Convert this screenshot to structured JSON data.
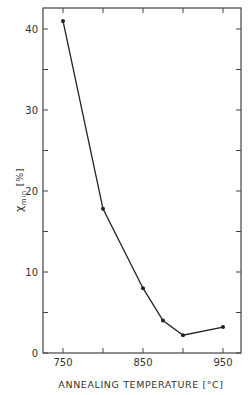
{
  "chart_data": {
    "type": "line",
    "title": "",
    "xlabel": "ANNEALING TEMPERATURE [°C]",
    "ylabel_main": "χ",
    "ylabel_sub": "min",
    "ylabel_unit": "[%]",
    "xlim": [
      725,
      975
    ],
    "ylim": [
      0,
      43.6
    ],
    "x_ticks": [
      750,
      800,
      850,
      900,
      950
    ],
    "x_tick_labels": [
      "750",
      "",
      "850",
      "",
      "950"
    ],
    "y_ticks": [
      0,
      5,
      10,
      15,
      20,
      25,
      30,
      35,
      40
    ],
    "y_tick_labels": [
      "0",
      "",
      "10",
      "",
      "20",
      "",
      "30",
      "",
      "40"
    ],
    "grid": false,
    "legend": null,
    "series": [
      {
        "name": "χmin",
        "x": [
          750,
          800,
          850,
          875,
          900,
          950
        ],
        "values": [
          41.0,
          17.8,
          8.0,
          4.0,
          2.2,
          3.2
        ],
        "marker": "dot",
        "color": "#222222"
      }
    ]
  },
  "style": {
    "line_color": "#222222",
    "frame_color": "#444444"
  }
}
